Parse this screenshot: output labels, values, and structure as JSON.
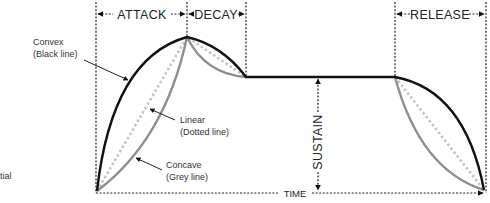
{
  "diagram": {
    "phases": {
      "attack": "ATTACK",
      "decay": "DECAY",
      "sustain": "SUSTAIN",
      "release": "RELEASE"
    },
    "axis_label": "TIME",
    "legend": {
      "convex": {
        "name": "Convex",
        "desc": "(Black line)",
        "color": "#111111"
      },
      "linear": {
        "name": "Linear",
        "desc": "(Dotted line)",
        "color": "#c2c4ca"
      },
      "concave": {
        "name": "Concave",
        "desc": "(Grey line)",
        "color": "#8e8e8e"
      }
    },
    "clipped_text": "tial"
  }
}
